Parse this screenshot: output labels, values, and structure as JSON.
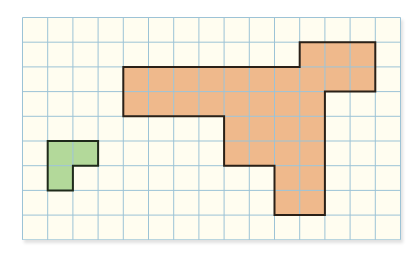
{
  "diagram": {
    "type": "grid-shapes",
    "grid": {
      "columns": 15,
      "rows": 9,
      "cell_width": 25.2,
      "cell_height": 24.7,
      "background_color": "#fffdf0",
      "line_color": "#9cc3d6"
    },
    "shapes": [
      {
        "name": "orange-shape",
        "fill_color": "#efb98c",
        "stroke_color": "#2a2017",
        "cell_count": 35,
        "cells": [
          [
            11,
            1
          ],
          [
            12,
            1
          ],
          [
            13,
            1
          ],
          [
            4,
            2
          ],
          [
            5,
            2
          ],
          [
            6,
            2
          ],
          [
            7,
            2
          ],
          [
            8,
            2
          ],
          [
            9,
            2
          ],
          [
            10,
            2
          ],
          [
            11,
            2
          ],
          [
            12,
            2
          ],
          [
            13,
            2
          ],
          [
            4,
            3
          ],
          [
            5,
            3
          ],
          [
            6,
            3
          ],
          [
            7,
            3
          ],
          [
            8,
            3
          ],
          [
            9,
            3
          ],
          [
            10,
            3
          ],
          [
            11,
            3
          ],
          [
            8,
            4
          ],
          [
            9,
            4
          ],
          [
            10,
            4
          ],
          [
            11,
            4
          ],
          [
            8,
            5
          ],
          [
            9,
            5
          ],
          [
            10,
            5
          ],
          [
            11,
            5
          ],
          [
            10,
            6
          ],
          [
            11,
            6
          ],
          [
            10,
            7
          ],
          [
            11,
            7
          ]
        ],
        "outline": [
          [
            11,
            1
          ],
          [
            14,
            1
          ],
          [
            14,
            3
          ],
          [
            12,
            3
          ],
          [
            12,
            8
          ],
          [
            10,
            8
          ],
          [
            10,
            6
          ],
          [
            8,
            6
          ],
          [
            8,
            4
          ],
          [
            4,
            4
          ],
          [
            4,
            2
          ],
          [
            11,
            2
          ]
        ]
      },
      {
        "name": "green-shape",
        "fill_color": "#b3d99a",
        "stroke_color": "#1f2a1a",
        "cell_count": 3,
        "cells": [
          [
            1,
            5
          ],
          [
            2,
            5
          ],
          [
            1,
            6
          ]
        ],
        "outline": [
          [
            1,
            5
          ],
          [
            3,
            5
          ],
          [
            3,
            6
          ],
          [
            2,
            6
          ],
          [
            2,
            7
          ],
          [
            1,
            7
          ]
        ]
      }
    ]
  }
}
